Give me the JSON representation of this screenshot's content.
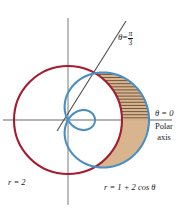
{
  "figure": {
    "kind": "polar-graph",
    "width": 187,
    "height": 212,
    "background": "#ffffff"
  },
  "colors": {
    "circle_red": "#a51c30",
    "limacon_blue": "#4a8fc4",
    "region_fill": "#d6b189",
    "hatch": "#5a4630",
    "axis_gray": "#9a9a9a",
    "ray_gray": "#4d4d4d",
    "text": "#1a1a1a"
  },
  "labels": {
    "ray_angle": {
      "theta": "θ",
      "equals": "=",
      "numerator": "π",
      "denominator": "3"
    },
    "polar_axis_angle": "θ = 0",
    "polar_axis_line1": "Polar",
    "polar_axis_line2": "axis",
    "circle_equation": "r = 2",
    "limacon_equation": "r = 1 + 2 cos θ"
  },
  "chart_data": {
    "type": "line",
    "title": "",
    "coordinate_system": "polar",
    "pole_px": [
      68,
      120
    ],
    "units_per_pixel": 27,
    "axes": {
      "polar_axis_px": {
        "y": 120,
        "x_start": 3,
        "x_end": 172
      },
      "vertical_axis_px": {
        "x": 68,
        "y_start": 18,
        "y_end": 205
      },
      "grid": false
    },
    "series": [
      {
        "name": "r = 2",
        "equation": "r = 2",
        "color": "#a51c30",
        "curve": "circle",
        "radius_units": 2,
        "radius_px": 54,
        "theta_range_rad": [
          0,
          6.283185307
        ],
        "points_polar": [
          {
            "theta_rad": 0.0,
            "r": 2
          },
          {
            "theta_rad": 1.047197551,
            "r": 2
          },
          {
            "theta_rad": 1.570796327,
            "r": 2
          },
          {
            "theta_rad": 3.141592654,
            "r": 2
          },
          {
            "theta_rad": 4.71238898,
            "r": 2
          },
          {
            "theta_rad": 5.235987756,
            "r": 2
          }
        ]
      },
      {
        "name": "r = 1 + 2 cos θ",
        "equation": "r = 1 + 2 cos θ",
        "color": "#4a8fc4",
        "curve": "limacon-with-inner-loop",
        "a": 1,
        "b": 2,
        "max_r_units": 3,
        "max_r_px": 81,
        "inner_loop_theta_rad": [
          2.094395102,
          4.188790205
        ],
        "points_polar": [
          {
            "theta_rad": 0.0,
            "r": 3.0
          },
          {
            "theta_rad": 0.523598776,
            "r": 2.732
          },
          {
            "theta_rad": 1.047197551,
            "r": 2.0
          },
          {
            "theta_rad": 1.570796327,
            "r": 1.0
          },
          {
            "theta_rad": 2.094395102,
            "r": 0.0
          },
          {
            "theta_rad": 2.617993878,
            "r": -0.732
          },
          {
            "theta_rad": 3.141592654,
            "r": -1.0
          },
          {
            "theta_rad": 3.665191429,
            "r": -0.732
          },
          {
            "theta_rad": 4.188790205,
            "r": 0.0
          },
          {
            "theta_rad": 4.71238898,
            "r": 1.0
          },
          {
            "theta_rad": 5.235987756,
            "r": 2.0
          },
          {
            "theta_rad": 5.759586532,
            "r": 2.732
          },
          {
            "theta_rad": 6.283185307,
            "r": 3.0
          }
        ]
      },
      {
        "name": "θ = π/3 ray",
        "equation": "θ = π/3",
        "color": "#4d4d4d",
        "curve": "ray",
        "theta_rad": 1.047197551,
        "from_px": [
          57,
          131
        ],
        "to_px": [
          126,
          21
        ]
      }
    ],
    "intersections_polar": [
      {
        "theta_rad": 1.047197551,
        "r": 2,
        "px": [
          104,
          73
        ]
      },
      {
        "theta_rad": 5.235987756,
        "r": 2,
        "px": [
          104,
          167
        ]
      }
    ],
    "shaded_region": {
      "description": "Region inside the limaçon r = 1 + 2 cos θ and outside the circle r = 2",
      "fill": "#d6b189",
      "hatched_above_axis": true,
      "bounded_by": [
        "r = 1 + 2 cos θ",
        "r = 2"
      ],
      "theta_range_rad": [
        -1.047197551,
        1.047197551
      ]
    },
    "annotations": [
      {
        "text": "θ = π/3",
        "px": [
          118,
          30
        ]
      },
      {
        "text": "θ = 0",
        "px": [
          155,
          108
        ]
      },
      {
        "text": "Polar axis",
        "px": [
          155,
          121
        ]
      },
      {
        "text": "r = 2",
        "px": [
          8,
          177
        ]
      },
      {
        "text": "r = 1 + 2 cos θ",
        "px": [
          104,
          182
        ]
      }
    ]
  }
}
